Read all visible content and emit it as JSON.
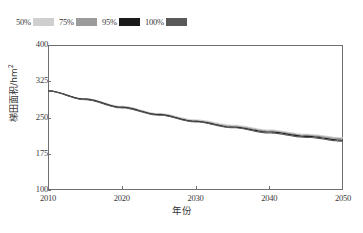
{
  "chart_data": {
    "type": "line",
    "title": "",
    "subtitle": "",
    "xlabel": "年份",
    "ylabel": "梯田面积/hm²",
    "ylabel_main": "梯田面积/hm",
    "ylabel_sup": "2",
    "xlim": [
      2010,
      2050
    ],
    "ylim": [
      100,
      400
    ],
    "grid": false,
    "legend_position": "above-plot-left",
    "x_ticks": [
      2010,
      2020,
      2030,
      2040,
      2050
    ],
    "x_tick_labels": [
      "2010",
      "2020",
      "2030",
      "2040",
      "2050"
    ],
    "y_ticks": [
      100,
      175,
      250,
      325,
      400
    ],
    "y_tick_labels": [
      "100",
      "175",
      "250",
      "325",
      "400"
    ],
    "x": [
      2010,
      2015,
      2020,
      2025,
      2030,
      2035,
      2040,
      2045,
      2050
    ],
    "series": [
      {
        "name": "50%",
        "label": "50%",
        "color": "#cfcfcf",
        "values": [
          305,
          289,
          273,
          258,
          245,
          234,
          224,
          215,
          208
        ]
      },
      {
        "name": "75%",
        "label": "75%",
        "color": "#9b9b9b",
        "values": [
          305,
          288,
          272,
          257,
          243,
          232,
          222,
          213,
          206
        ]
      },
      {
        "name": "95%",
        "label": "95%",
        "color": "#1a1a1a",
        "values": [
          305,
          288,
          271,
          256,
          242,
          230,
          220,
          211,
          203
        ]
      },
      {
        "name": "100%",
        "label": "100%",
        "color": "#595959",
        "values": [
          305,
          287,
          270,
          255,
          241,
          229,
          218,
          209,
          201
        ]
      }
    ]
  },
  "legend": {
    "entries": [
      {
        "label": "50%",
        "color": "#cfcfcf"
      },
      {
        "label": "75%",
        "color": "#9b9b9b"
      },
      {
        "label": "95%",
        "color": "#1a1a1a"
      },
      {
        "label": "100%",
        "color": "#595959"
      }
    ]
  },
  "colors": {
    "axis": "#6e6e6e",
    "text": "#3a3a3a",
    "background": "#ffffff"
  }
}
